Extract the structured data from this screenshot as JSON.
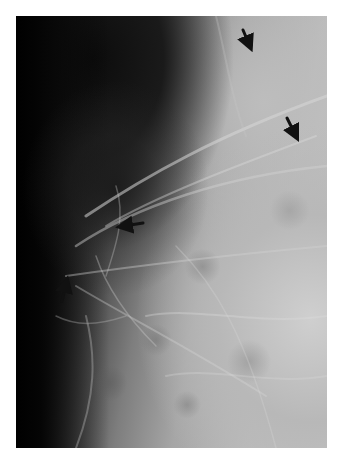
{
  "image": {
    "type": "radiograph",
    "description": "Grayscale mammographic / soft-tissue X-ray with four black arrows pointing to features",
    "frame": {
      "x": 16,
      "y": 16,
      "width": 311,
      "height": 432
    },
    "colors": {
      "background": "#ffffff",
      "dark_region": "#050505",
      "tissue_mid": "#8a8a8a",
      "tissue_bright": "#c8c8c8",
      "arrow": "#111111"
    }
  },
  "annotations": {
    "arrows": [
      {
        "id": "arrow-top-right",
        "tail": [
          243,
          30
        ],
        "head": [
          251,
          48
        ],
        "direction": "down-right"
      },
      {
        "id": "arrow-right",
        "tail": [
          287,
          118
        ],
        "head": [
          297,
          138
        ],
        "direction": "down-right"
      },
      {
        "id": "arrow-center",
        "tail": [
          143,
          223
        ],
        "head": [
          120,
          227
        ],
        "direction": "left"
      },
      {
        "id": "arrow-lower-left",
        "tail": [
          62,
          301
        ],
        "head": [
          67,
          280
        ],
        "direction": "up"
      }
    ]
  }
}
